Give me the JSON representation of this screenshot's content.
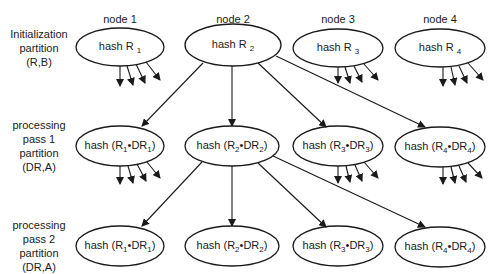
{
  "nodes": [
    {
      "label": "node 1",
      "cx": 120
    },
    {
      "label": "node 2",
      "cx": 233
    },
    {
      "label": "node 3",
      "cx": 338
    },
    {
      "label": "node 4",
      "cx": 440
    }
  ],
  "rows": [
    {
      "label_lines": [
        "Initialization",
        "partition",
        "(R,B)"
      ],
      "cy": 47
    },
    {
      "label_lines": [
        "processing",
        "pass 1",
        "partition",
        "(DR,A)"
      ],
      "cy": 146
    },
    {
      "label_lines": [
        "processing",
        "pass 2",
        "partition",
        "(DR,A)"
      ],
      "cy": 246
    }
  ],
  "ellipses": {
    "row1": [
      {
        "prefix": "hash R",
        "sub": "1"
      },
      {
        "prefix": "hash R",
        "sub": "2"
      },
      {
        "prefix": "hash R",
        "sub": "3"
      },
      {
        "prefix": "hash R",
        "sub": "4"
      }
    ],
    "row2": [
      {
        "pre": "hash  (R",
        "s1": "1",
        "mid": "•DR",
        "s2": "1",
        "post": ")"
      },
      {
        "pre": "hash  (R",
        "s1": "2",
        "mid": "•DR",
        "s2": "2",
        "post": ")"
      },
      {
        "pre": "hash  (R",
        "s1": "3",
        "mid": "•DR",
        "s2": "3",
        "post": ")"
      },
      {
        "pre": "hash  (R",
        "s1": "4",
        "mid": "•DR",
        "s2": "4",
        "post": ")"
      }
    ],
    "row3": [
      {
        "pre": "hash  (R",
        "s1": "1",
        "mid": "•DR",
        "s2": "1",
        "post": ")"
      },
      {
        "pre": "hash  (R",
        "s1": "2",
        "mid": "•DR",
        "s2": "2",
        "post": ")"
      },
      {
        "pre": "hash  (R",
        "s1": "3",
        "mid": "•DR",
        "s2": "3",
        "post": ")"
      },
      {
        "pre": "hash  (R",
        "s1": "4",
        "mid": "•DR",
        "s2": "4",
        "post": ")"
      }
    ]
  },
  "edges_description": "node 2 hash in each stage fans out to all four nodes of the next stage; nodes 1, 3, 4 show outgoing scatter arrows",
  "colors": {
    "stroke": "#1a1a1a",
    "background": "#ffffff"
  }
}
